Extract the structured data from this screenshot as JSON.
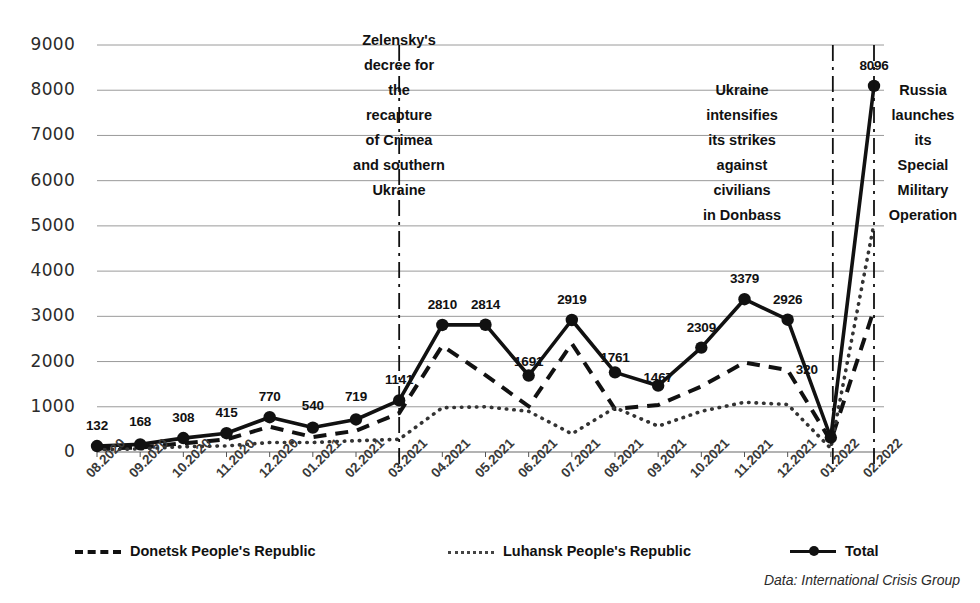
{
  "chart_data": {
    "type": "line",
    "title": "",
    "xlabel": "",
    "ylabel": "",
    "ylim": [
      0,
      9000
    ],
    "ytick_step": 1000,
    "grid": true,
    "legend_position": "bottom",
    "source_note": "Data: International Crisis Group",
    "categories": [
      "08.2020",
      "09.2020",
      "10.2020",
      "11.2020",
      "12.2020",
      "01.2021",
      "02.2021",
      "03.2021",
      "04.2021",
      "05.2021",
      "06.2021",
      "07.2021",
      "08.2021",
      "09.2021",
      "10.2021",
      "11.2021",
      "12.2021",
      "01.2022",
      "02.2022"
    ],
    "yticks": [
      "0",
      "1000",
      "2000",
      "3000",
      "4000",
      "5000",
      "6000",
      "7000",
      "8000",
      "9000"
    ],
    "series": [
      {
        "name": "Donetsk People's Republic",
        "style": "dashed",
        "values": [
          80,
          100,
          190,
          280,
          560,
          330,
          470,
          860,
          2350,
          1700,
          1010,
          2400,
          950,
          1040,
          1450,
          1980,
          1810,
          240,
          3150
        ]
      },
      {
        "name": "Luhansk People's Republic",
        "style": "dotted",
        "values": [
          52,
          68,
          118,
          135,
          210,
          210,
          249,
          281,
          980,
          1000,
          900,
          400,
          980,
          570,
          900,
          1100,
          1050,
          80,
          5050
        ]
      },
      {
        "name": "Total",
        "style": "solid-markers",
        "values": [
          132,
          168,
          308,
          415,
          770,
          540,
          719,
          1141,
          2810,
          2814,
          1691,
          2919,
          1761,
          1467,
          2309,
          3379,
          2926,
          320,
          8096
        ],
        "labels": [
          "132",
          "168",
          "308",
          "415",
          "770",
          "540",
          "719",
          "1141",
          "2810",
          "2814",
          "1691",
          "2919",
          "1761",
          "1467",
          "2309",
          "3379",
          "2926",
          "320",
          "8096"
        ]
      }
    ],
    "annotations": [
      {
        "id": "zelensky-decree",
        "lines": [
          "Zelensky's",
          "decree for",
          "the",
          "recapture",
          "of Crimea",
          "and southern",
          "Ukraine"
        ],
        "marker_category": "03.2021"
      },
      {
        "id": "ukraine-intensifies",
        "lines": [
          "Ukraine",
          "intensifies",
          "its strikes",
          "against",
          "civilians",
          "in Donbass"
        ],
        "marker_category": "01.2022"
      },
      {
        "id": "russia-operation",
        "lines": [
          "Russia",
          "launches",
          "its",
          "Special",
          "Military",
          "Operation"
        ],
        "marker_category": "02.2022"
      }
    ],
    "colors": {
      "line": "#111111",
      "grid": "#9a9a9a",
      "text": "#1a1a1a",
      "background": "#ffffff"
    }
  }
}
